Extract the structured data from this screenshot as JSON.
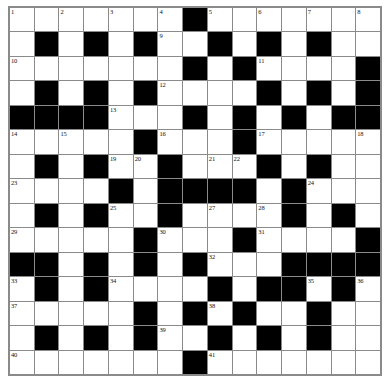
{
  "puzzle": {
    "title": "Crossword Grid",
    "kind": "crossword-grid",
    "rows": 15,
    "columns": 15,
    "colors": {
      "background": "#ffffff",
      "cell_fill": "#ffffff",
      "block_fill": "#000000",
      "grid_line": "#8a8a8a",
      "number_text": "#111111"
    },
    "blocks": [
      [
        8
      ],
      [
        2,
        4,
        6,
        9,
        11,
        13
      ],
      [
        8,
        10,
        15
      ],
      [
        2,
        4,
        6,
        11,
        13,
        15
      ],
      [
        1,
        2,
        3,
        4,
        8,
        10,
        12,
        14,
        15
      ],
      [
        6,
        10
      ],
      [
        2,
        4,
        7,
        11,
        13
      ],
      [
        5,
        7,
        8,
        9,
        10,
        12
      ],
      [
        2,
        4,
        7,
        12,
        14
      ],
      [
        6,
        10,
        15
      ],
      [
        1,
        2,
        4,
        6,
        8,
        12,
        13,
        14,
        15
      ],
      [
        2,
        4,
        9,
        11,
        12,
        14
      ],
      [
        6,
        8,
        10,
        13
      ],
      [
        2,
        4,
        6,
        9,
        11,
        13
      ],
      [
        8
      ]
    ],
    "numbers": [
      {
        "row": 1,
        "col": 1,
        "n": "1"
      },
      {
        "row": 1,
        "col": 3,
        "n": "2"
      },
      {
        "row": 1,
        "col": 5,
        "n": "3"
      },
      {
        "row": 1,
        "col": 7,
        "n": "4"
      },
      {
        "row": 1,
        "col": 9,
        "n": "5"
      },
      {
        "row": 1,
        "col": 11,
        "n": "6"
      },
      {
        "row": 1,
        "col": 13,
        "n": "7"
      },
      {
        "row": 1,
        "col": 15,
        "n": "8"
      },
      {
        "row": 2,
        "col": 7,
        "n": "9"
      },
      {
        "row": 3,
        "col": 1,
        "n": "10"
      },
      {
        "row": 3,
        "col": 11,
        "n": "11"
      },
      {
        "row": 4,
        "col": 7,
        "n": "12"
      },
      {
        "row": 5,
        "col": 5,
        "n": "13"
      },
      {
        "row": 6,
        "col": 1,
        "n": "14"
      },
      {
        "row": 6,
        "col": 3,
        "n": "15"
      },
      {
        "row": 6,
        "col": 7,
        "n": "16"
      },
      {
        "row": 6,
        "col": 11,
        "n": "17"
      },
      {
        "row": 6,
        "col": 15,
        "n": "18"
      },
      {
        "row": 7,
        "col": 5,
        "n": "19"
      },
      {
        "row": 7,
        "col": 6,
        "n": "20"
      },
      {
        "row": 7,
        "col": 9,
        "n": "21"
      },
      {
        "row": 7,
        "col": 10,
        "n": "22"
      },
      {
        "row": 8,
        "col": 1,
        "n": "23"
      },
      {
        "row": 8,
        "col": 13,
        "n": "24"
      },
      {
        "row": 9,
        "col": 5,
        "n": "25"
      },
      {
        "row": 9,
        "col": 7,
        "n": "26"
      },
      {
        "row": 9,
        "col": 9,
        "n": "27"
      },
      {
        "row": 9,
        "col": 11,
        "n": "28"
      },
      {
        "row": 10,
        "col": 1,
        "n": "29"
      },
      {
        "row": 10,
        "col": 7,
        "n": "30"
      },
      {
        "row": 10,
        "col": 11,
        "n": "31"
      },
      {
        "row": 11,
        "col": 9,
        "n": "32"
      },
      {
        "row": 12,
        "col": 1,
        "n": "33"
      },
      {
        "row": 12,
        "col": 5,
        "n": "34"
      },
      {
        "row": 12,
        "col": 13,
        "n": "35"
      },
      {
        "row": 12,
        "col": 15,
        "n": "36"
      },
      {
        "row": 13,
        "col": 1,
        "n": "37"
      },
      {
        "row": 13,
        "col": 9,
        "n": "38"
      },
      {
        "row": 14,
        "col": 7,
        "n": "39"
      },
      {
        "row": 15,
        "col": 1,
        "n": "40"
      },
      {
        "row": 15,
        "col": 9,
        "n": "41"
      }
    ],
    "letters": []
  }
}
